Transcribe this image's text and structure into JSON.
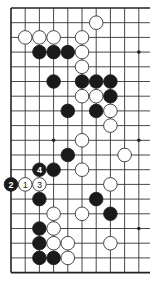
{
  "diagram": {
    "type": "go-board-fragment",
    "grid": {
      "columns": 10,
      "rows": 19,
      "left_edge_visible": true,
      "top_edge_visible": true,
      "bottom_edge_visible": true,
      "right_edge_visible": false
    },
    "star_points": [
      {
        "col": 9,
        "row": 3
      },
      {
        "col": 3,
        "row": 9
      },
      {
        "col": 9,
        "row": 9
      },
      {
        "col": 9,
        "row": 15
      }
    ],
    "stones": [
      {
        "color": "white",
        "col": 6,
        "row": 1
      },
      {
        "color": "white",
        "col": 1,
        "row": 2
      },
      {
        "color": "white",
        "col": 2,
        "row": 2
      },
      {
        "color": "white",
        "col": 3,
        "row": 2
      },
      {
        "color": "white",
        "col": 5,
        "row": 2
      },
      {
        "color": "black",
        "col": 2,
        "row": 3
      },
      {
        "color": "black",
        "col": 3,
        "row": 3
      },
      {
        "color": "black",
        "col": 4,
        "row": 3
      },
      {
        "color": "white",
        "col": 5,
        "row": 3
      },
      {
        "color": "white",
        "col": 5,
        "row": 4
      },
      {
        "color": "black",
        "col": 3,
        "row": 5
      },
      {
        "color": "black",
        "col": 5,
        "row": 5
      },
      {
        "color": "black",
        "col": 6,
        "row": 5
      },
      {
        "color": "black",
        "col": 7,
        "row": 5
      },
      {
        "color": "white",
        "col": 5,
        "row": 6
      },
      {
        "color": "white",
        "col": 6,
        "row": 6
      },
      {
        "color": "black",
        "col": 7,
        "row": 6
      },
      {
        "color": "black",
        "col": 4,
        "row": 7
      },
      {
        "color": "black",
        "col": 6,
        "row": 7
      },
      {
        "color": "white",
        "col": 7,
        "row": 7
      },
      {
        "color": "white",
        "col": 7,
        "row": 8
      },
      {
        "color": "white",
        "col": 5,
        "row": 9
      },
      {
        "color": "black",
        "col": 4,
        "row": 10
      },
      {
        "color": "white",
        "col": 8,
        "row": 10
      },
      {
        "color": "black",
        "col": 2,
        "row": 11,
        "label": "4"
      },
      {
        "color": "black",
        "col": 3,
        "row": 11
      },
      {
        "color": "white",
        "col": 5,
        "row": 11
      },
      {
        "color": "black",
        "col": 0,
        "row": 12,
        "label": "2"
      },
      {
        "color": "white",
        "col": 1,
        "row": 12,
        "label": "1"
      },
      {
        "color": "white",
        "col": 2,
        "row": 12,
        "label": "3"
      },
      {
        "color": "white",
        "col": 7,
        "row": 12
      },
      {
        "color": "black",
        "col": 2,
        "row": 13
      },
      {
        "color": "black",
        "col": 6,
        "row": 13
      },
      {
        "color": "white",
        "col": 3,
        "row": 14
      },
      {
        "color": "white",
        "col": 5,
        "row": 14
      },
      {
        "color": "black",
        "col": 7,
        "row": 14
      },
      {
        "color": "black",
        "col": 2,
        "row": 15
      },
      {
        "color": "white",
        "col": 3,
        "row": 15
      },
      {
        "color": "black",
        "col": 2,
        "row": 16
      },
      {
        "color": "white",
        "col": 3,
        "row": 16
      },
      {
        "color": "white",
        "col": 4,
        "row": 16
      },
      {
        "color": "white",
        "col": 7,
        "row": 16
      },
      {
        "color": "black",
        "col": 2,
        "row": 17
      },
      {
        "color": "black",
        "col": 3,
        "row": 17
      },
      {
        "color": "white",
        "col": 4,
        "row": 17
      }
    ],
    "move_labels": [
      "1",
      "2",
      "3",
      "4"
    ],
    "colors": {
      "black_stone": "#1a1a1a",
      "white_stone": "#ffffff",
      "line": "#333333",
      "background": "#ffffff"
    }
  }
}
